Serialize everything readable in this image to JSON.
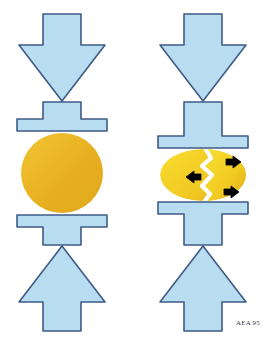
{
  "figure": {
    "signature": "AEA 95",
    "background_color": "#ffffff"
  },
  "colors": {
    "platen_fill": "#b8dcf0",
    "platen_stroke": "#3f5b87",
    "specimen_intact_fill": "#e8b020",
    "specimen_intact_fill_light": "#f0c435",
    "specimen_fractured_fill": "#f5d320",
    "specimen_fractured_fill_dark": "#e0a81c",
    "crack_color": "#ffffff",
    "motion_arrow_color": "#000000",
    "signature_color": "#3a3a4a"
  },
  "panels": [
    {
      "id": "intact",
      "label": "Intact specimen under compression",
      "specimen": {
        "name": "intact-specimen",
        "shape": "circle",
        "state": "intact",
        "center_x": 62,
        "center_y": 173,
        "radius_x": 41,
        "radius_y": 40
      },
      "top_arrow": {
        "name": "compression-arrow-top",
        "direction": "down",
        "label": "Applied load (downward)"
      },
      "bottom_arrow": {
        "name": "compression-arrow-bottom",
        "direction": "up",
        "label": "Reaction load (upward)"
      },
      "top_platen": {
        "name": "platen-top",
        "label": "Upper press platen"
      },
      "bottom_platen": {
        "name": "platen-bottom",
        "label": "Lower press platen"
      },
      "motion_arrows": []
    },
    {
      "id": "fractured",
      "label": "Fractured specimen with separating fragments",
      "specimen": {
        "name": "fractured-specimen",
        "shape": "ellipse",
        "state": "fractured",
        "center_x": 203,
        "center_y": 175,
        "radius_x": 43,
        "radius_y": 26
      },
      "top_arrow": {
        "name": "compression-arrow-top",
        "direction": "down",
        "label": "Applied load (downward)"
      },
      "bottom_arrow": {
        "name": "compression-arrow-bottom",
        "direction": "up",
        "label": "Reaction load (upward)"
      },
      "top_platen": {
        "name": "platen-top",
        "label": "Upper press platen"
      },
      "bottom_platen": {
        "name": "platen-bottom",
        "label": "Lower press platen"
      },
      "crack": {
        "name": "fracture-crack",
        "label": "Vertical zigzag fracture",
        "orientation": "vertical-zigzag"
      },
      "motion_arrows": [
        {
          "name": "motion-arrow-left",
          "direction": "left",
          "x": 194,
          "y": 177,
          "label": "Left fragment moves left"
        },
        {
          "name": "motion-arrow-upper-right",
          "direction": "right",
          "x": 233,
          "y": 162,
          "label": "Right fragment moves right"
        },
        {
          "name": "motion-arrow-lower-right",
          "direction": "right",
          "x": 231,
          "y": 192,
          "label": "Right fragment moves right"
        }
      ]
    }
  ]
}
